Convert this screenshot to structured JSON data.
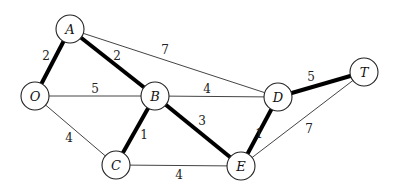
{
  "graph": {
    "node_radius": 14,
    "nodes": [
      {
        "id": "O",
        "label": "O",
        "x": 35,
        "y": 96
      },
      {
        "id": "A",
        "label": "A",
        "x": 70,
        "y": 29
      },
      {
        "id": "B",
        "label": "B",
        "x": 155,
        "y": 96
      },
      {
        "id": "C",
        "label": "C",
        "x": 116,
        "y": 165
      },
      {
        "id": "D",
        "label": "D",
        "x": 278,
        "y": 97
      },
      {
        "id": "E",
        "label": "E",
        "x": 241,
        "y": 166
      },
      {
        "id": "T",
        "label": "T",
        "x": 364,
        "y": 72
      }
    ],
    "edges": [
      {
        "from": "O",
        "to": "A",
        "weight": "2",
        "bold": true,
        "label_x": 46,
        "label_y": 56
      },
      {
        "from": "A",
        "to": "B",
        "weight": "2",
        "bold": true,
        "label_x": 117,
        "label_y": 56
      },
      {
        "from": "A",
        "to": "D",
        "weight": "7",
        "bold": false,
        "label_x": 165,
        "label_y": 50
      },
      {
        "from": "O",
        "to": "B",
        "weight": "5",
        "bold": false,
        "label_x": 95,
        "label_y": 89
      },
      {
        "from": "O",
        "to": "C",
        "weight": "4",
        "bold": false,
        "label_x": 69,
        "label_y": 138
      },
      {
        "from": "B",
        "to": "C",
        "weight": "1",
        "bold": true,
        "label_x": 144,
        "label_y": 135
      },
      {
        "from": "B",
        "to": "D",
        "weight": "4",
        "bold": false,
        "label_x": 207,
        "label_y": 89
      },
      {
        "from": "B",
        "to": "E",
        "weight": "3",
        "bold": true,
        "label_x": 202,
        "label_y": 121
      },
      {
        "from": "C",
        "to": "E",
        "weight": "4",
        "bold": false,
        "label_x": 179,
        "label_y": 175
      },
      {
        "from": "D",
        "to": "E",
        "weight": "1",
        "bold": true,
        "label_x": 259,
        "label_y": 134
      },
      {
        "from": "D",
        "to": "T",
        "weight": "5",
        "bold": true,
        "label_x": 311,
        "label_y": 77
      },
      {
        "from": "E",
        "to": "T",
        "weight": "7",
        "bold": false,
        "label_x": 309,
        "label_y": 129
      }
    ]
  }
}
